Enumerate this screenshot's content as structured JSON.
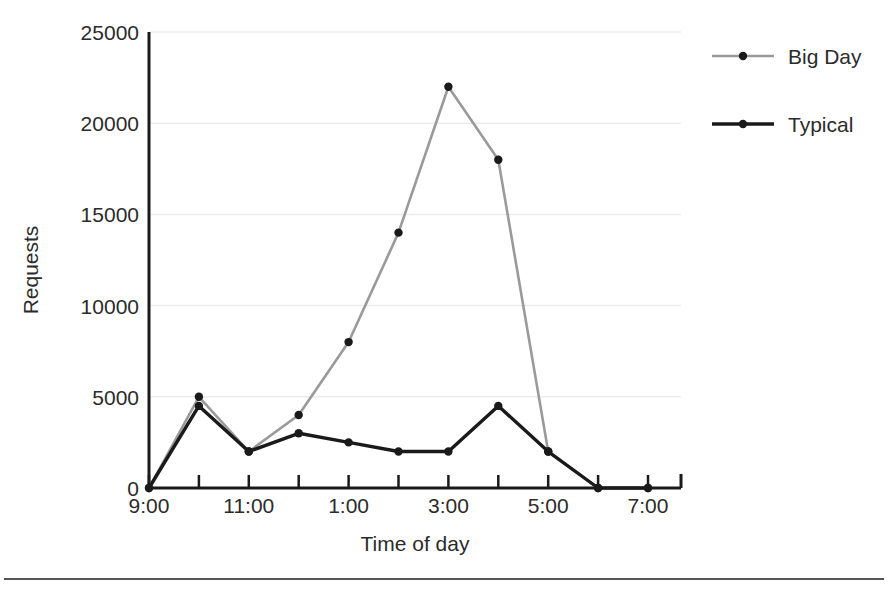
{
  "chart_data": {
    "type": "line",
    "title": "",
    "xlabel": "Time of day",
    "ylabel": "Requests",
    "grid": true,
    "legend_position": "right",
    "x": [
      "9:00",
      "10:00",
      "11:00",
      "12:00",
      "1:00",
      "2:00",
      "3:00",
      "4:00",
      "5:00",
      "6:00",
      "7:00"
    ],
    "x_tick_labels": [
      "9:00",
      "",
      "11:00",
      "",
      "1:00",
      "",
      "3:00",
      "",
      "5:00",
      "",
      "7:00"
    ],
    "y_tick_labels": [
      "0",
      "5000",
      "10000",
      "15000",
      "20000",
      "25000"
    ],
    "y_ticks": [
      0,
      5000,
      10000,
      15000,
      20000,
      25000
    ],
    "ylim": [
      0,
      25000
    ],
    "series": [
      {
        "name": "Big Day",
        "color": "#9a9a9a",
        "marker_color": "#1a1a1a",
        "values": [
          0,
          5000,
          2000,
          4000,
          8000,
          14000,
          22000,
          18000,
          2000,
          0,
          0
        ]
      },
      {
        "name": "Typical",
        "color": "#1a1a1a",
        "marker_color": "#1a1a1a",
        "values": [
          0,
          4500,
          2000,
          3000,
          2500,
          2000,
          2000,
          4500,
          2000,
          0,
          0
        ]
      }
    ]
  },
  "legend": {
    "items": [
      {
        "label": "Big Day"
      },
      {
        "label": "Typical"
      }
    ]
  },
  "axes": {
    "x_title": "Time of day",
    "y_title": "Requests"
  },
  "caption": {
    "text": ""
  },
  "colors": {
    "big_day": "#9a9a9a",
    "typical": "#1a1a1a",
    "axis": "#1a1a1a",
    "grid": "#ececec",
    "background": "#ffffff"
  }
}
